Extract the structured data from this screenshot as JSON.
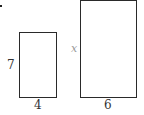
{
  "diagram": {
    "small_rect": {
      "height_label": "7",
      "width_label": "4"
    },
    "large_rect": {
      "height_label": "x",
      "width_label": "6"
    }
  }
}
